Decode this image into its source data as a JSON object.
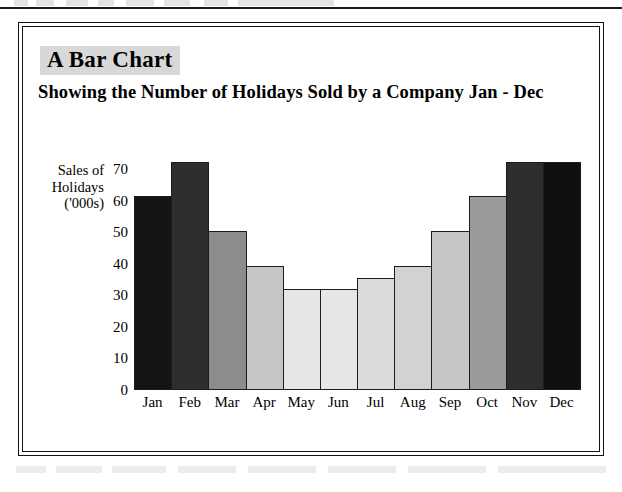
{
  "page": {
    "background_color": "#ffffff",
    "frame_color": "#111111"
  },
  "chart_data": {
    "type": "bar",
    "title": "A Bar Chart",
    "subtitle": "Showing the Number of Holidays Sold by a Company Jan - Dec",
    "xlabel": "",
    "ylabel": "Sales of Holidays ('000s)",
    "ylabel_lines": [
      "Sales of",
      "Holidays",
      "('000s)"
    ],
    "categories": [
      "Jan",
      "Feb",
      "Mar",
      "Apr",
      "May",
      "Jun",
      "Jul",
      "Aug",
      "Sep",
      "Oct",
      "Nov",
      "Dec"
    ],
    "values": [
      61.5,
      72.5,
      50.5,
      39.5,
      32,
      32,
      35.5,
      39.5,
      50.5,
      61.5,
      72.5,
      72.5
    ],
    "ylim": [
      0,
      73
    ],
    "yticks": [
      0,
      10,
      20,
      30,
      40,
      50,
      60,
      70
    ],
    "ytick_labels": [
      "0",
      "10",
      "20",
      "30",
      "40",
      "50",
      "60",
      "70"
    ],
    "grid": false,
    "legend": false,
    "bar_colors": [
      "#141414",
      "#2e2e2e",
      "#8c8c8c",
      "#c6c6c6",
      "#e6e6e6",
      "#e6e6e6",
      "#dcdcdc",
      "#d2d2d2",
      "#c6c6c6",
      "#9a9a9a",
      "#2e2e2e",
      "#101010"
    ],
    "bar_edge_color": "#1c1c1c",
    "title_highlight_color": "#d8d8d8"
  }
}
